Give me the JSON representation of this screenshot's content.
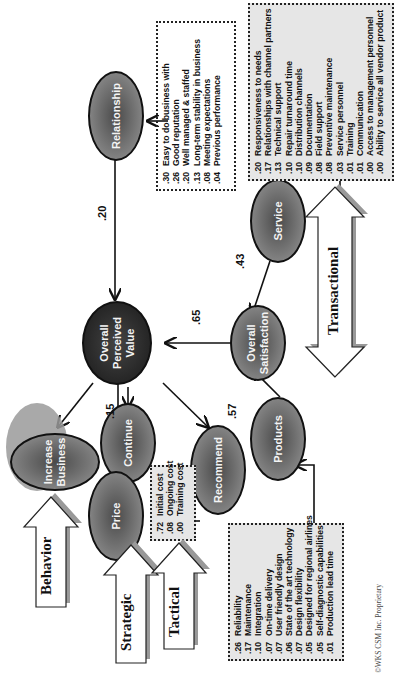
{
  "nodes": {
    "increase_business": "Increase Business",
    "continue": "Continue",
    "recommend": "Recommend",
    "relationship": "Relationship",
    "overall_perceived_value": "Overall Perceived Value",
    "price": "Price",
    "service": "Service",
    "overall_satisfaction": "Overall Satisfaction",
    "products": "Products"
  },
  "weights": {
    "relationship_to_value": ".20",
    "price_to_value": ".15",
    "satisfaction_to_value": ".65",
    "service_to_satisfaction": ".43",
    "products_to_satisfaction": ".57"
  },
  "category_arrows": {
    "behavior": "Behavior",
    "strategic": "Strategic",
    "tactical": "Tactical",
    "transactional": "Transactional"
  },
  "relationship_factors": [
    {
      "v": ".30",
      "label": "Easy to do business with"
    },
    {
      "v": ".26",
      "label": "Good reputation"
    },
    {
      "v": ".20",
      "label": "Well managed & staffed"
    },
    {
      "v": ".13",
      "label": "Long-term stability in business"
    },
    {
      "v": ".08",
      "label": "Meeting expectations"
    },
    {
      "v": ".04",
      "label": "Previous performance"
    }
  ],
  "service_factors": [
    {
      "v": ".20",
      "label": "Responsiveness to needs"
    },
    {
      "v": ".17",
      "label": "Relationships with channel partners"
    },
    {
      "v": ".13",
      "label": "Technical support"
    },
    {
      "v": ".10",
      "label": "Repair turnaround time"
    },
    {
      "v": ".10",
      "label": "Distribution channels"
    },
    {
      "v": ".09",
      "label": "Documentation"
    },
    {
      "v": ".08",
      "label": "Field support"
    },
    {
      "v": ".08",
      "label": "Preventive maintenance"
    },
    {
      "v": ".03",
      "label": "Service personnel"
    },
    {
      "v": ".01",
      "label": "Training"
    },
    {
      "v": ".01",
      "label": "Communication"
    },
    {
      "v": ".00",
      "label": "Access to management personnel"
    },
    {
      "v": ".00",
      "label": "Ability to service all vendor product"
    }
  ],
  "price_factors": [
    {
      "v": ".72",
      "label": "Initial cost"
    },
    {
      "v": ".08",
      "label": "Ongoing cost"
    },
    {
      "v": ".00",
      "label": "Training cost"
    }
  ],
  "product_factors": [
    {
      "v": ".26",
      "label": "Reliability"
    },
    {
      "v": ".17",
      "label": "Maintenance"
    },
    {
      "v": ".10",
      "label": "Integration"
    },
    {
      "v": ".07",
      "label": "On-time delivery"
    },
    {
      "v": ".07",
      "label": "User friendly design"
    },
    {
      "v": ".06",
      "label": "State of the art technology"
    },
    {
      "v": ".07",
      "label": "Design flexibility"
    },
    {
      "v": ".05",
      "label": "Designed for regional airlines"
    },
    {
      "v": ".05",
      "label": "Self-diagnostic capabilities"
    },
    {
      "v": ".01",
      "label": "Production lead time"
    }
  ],
  "footer": "©WKS CSM Inc. Proprietary"
}
